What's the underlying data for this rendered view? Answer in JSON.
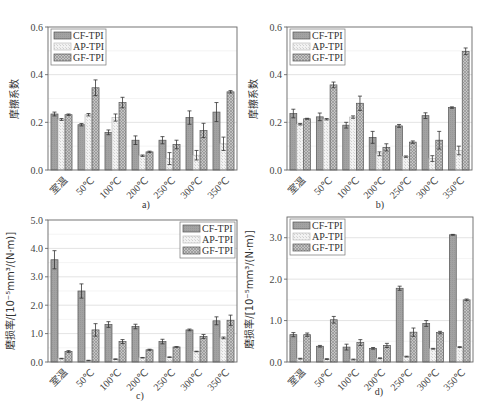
{
  "colors": {
    "cf": "#9e9e9e",
    "ap": "#ececec",
    "gf": "#b8b8b8",
    "outline": "#555555",
    "grid": "#d8d8d8"
  },
  "chart_data": [
    {
      "panel": "a)",
      "type": "bar",
      "title": "",
      "xlabel": "",
      "ylabel": "摩擦系数",
      "ylim": [
        0,
        0.6
      ],
      "yticks": [
        "0.0",
        "0.2",
        "0.4",
        "0.6"
      ],
      "categories": [
        "室温",
        "50℃",
        "100℃",
        "200℃",
        "250℃",
        "300℃",
        "350℃"
      ],
      "legend_position": "upper-left",
      "series": [
        {
          "name": "CF-TPI",
          "values": [
            0.235,
            0.19,
            0.158,
            0.125,
            0.125,
            0.22,
            0.243
          ],
          "errors": [
            0.008,
            0.005,
            0.01,
            0.018,
            0.015,
            0.028,
            0.04
          ]
        },
        {
          "name": "AP-TPI",
          "values": [
            0.212,
            0.232,
            0.22,
            0.06,
            0.048,
            0.062,
            0.11
          ],
          "errors": [
            0.004,
            0.005,
            0.015,
            0.003,
            0.025,
            0.02,
            0.028
          ]
        },
        {
          "name": "GF-TPI",
          "values": [
            0.232,
            0.345,
            0.283,
            0.076,
            0.107,
            0.166,
            0.328
          ],
          "errors": [
            0.003,
            0.033,
            0.022,
            0.003,
            0.018,
            0.03,
            0.005
          ]
        }
      ]
    },
    {
      "panel": "b)",
      "type": "bar",
      "title": "",
      "xlabel": "",
      "ylabel": "摩擦系数",
      "ylim": [
        0,
        0.6
      ],
      "yticks": [
        "0.0",
        "0.2",
        "0.4",
        "0.6"
      ],
      "categories": [
        "室温",
        "50℃",
        "100℃",
        "200℃",
        "250℃",
        "300℃",
        "350℃"
      ],
      "legend_position": "upper-left",
      "series": [
        {
          "name": "CF-TPI",
          "values": [
            0.237,
            0.223,
            0.188,
            0.137,
            0.185,
            0.228,
            0.262
          ],
          "errors": [
            0.018,
            0.016,
            0.012,
            0.025,
            0.006,
            0.012,
            0.003
          ]
        },
        {
          "name": "AP-TPI",
          "values": [
            0.192,
            0.213,
            0.222,
            0.068,
            0.056,
            0.048,
            0.082
          ],
          "errors": [
            0.003,
            0.003,
            0.005,
            0.008,
            0.003,
            0.012,
            0.018
          ]
        },
        {
          "name": "GF-TPI",
          "values": [
            0.215,
            0.357,
            0.28,
            0.095,
            0.117,
            0.125,
            0.498
          ],
          "errors": [
            0.002,
            0.012,
            0.03,
            0.015,
            0.005,
            0.037,
            0.014
          ]
        }
      ]
    },
    {
      "panel": "c)",
      "type": "bar",
      "title": "",
      "xlabel": "",
      "ylabel": "磨损率/[10⁻⁵mm³/(N·m)]",
      "ylim": [
        0,
        5.0
      ],
      "yticks": [
        "0.0",
        "1.0",
        "2.0",
        "3.0",
        "4.0",
        "5.0"
      ],
      "categories": [
        "室温",
        "50℃",
        "100℃",
        "200℃",
        "250℃",
        "300℃",
        "350℃"
      ],
      "legend_position": "upper-right",
      "series": [
        {
          "name": "CF-TPI",
          "values": [
            3.6,
            2.5,
            1.32,
            1.25,
            0.72,
            1.13,
            1.45
          ],
          "errors": [
            0.32,
            0.25,
            0.1,
            0.08,
            0.08,
            0.03,
            0.14
          ]
        },
        {
          "name": "AP-TPI",
          "values": [
            0.12,
            0.05,
            0.1,
            0.15,
            0.17,
            0.37,
            0.85
          ],
          "errors": [
            0.01,
            0.01,
            0.01,
            0.01,
            0.01,
            0.01,
            0.03
          ]
        },
        {
          "name": "GF-TPI",
          "values": [
            0.37,
            1.13,
            0.72,
            0.43,
            0.53,
            0.9,
            1.47
          ],
          "errors": [
            0.03,
            0.22,
            0.07,
            0.02,
            0.01,
            0.07,
            0.18
          ]
        }
      ]
    },
    {
      "panel": "d)",
      "type": "bar",
      "title": "",
      "xlabel": "",
      "ylabel": "磨损率/[10⁻⁵mm³/(N·m)]",
      "ylim": [
        0,
        3.5
      ],
      "yticks": [
        "0.0",
        "1.0",
        "2.0",
        "3.0"
      ],
      "categories": [
        "室温",
        "50℃",
        "100℃",
        "200℃",
        "250℃",
        "300℃",
        "350℃"
      ],
      "legend_position": "upper-left",
      "series": [
        {
          "name": "CF-TPI",
          "values": [
            0.66,
            0.38,
            0.36,
            0.33,
            1.78,
            0.93,
            3.07
          ],
          "errors": [
            0.05,
            0.02,
            0.07,
            0.02,
            0.05,
            0.07,
            0.01
          ]
        },
        {
          "name": "AP-TPI",
          "values": [
            0.08,
            0.07,
            0.06,
            0.09,
            0.13,
            0.32,
            0.36
          ],
          "errors": [
            0.01,
            0.01,
            0.01,
            0.01,
            0.01,
            0.01,
            0.01
          ]
        },
        {
          "name": "GF-TPI",
          "values": [
            0.66,
            1.02,
            0.47,
            0.4,
            0.72,
            0.71,
            1.5
          ],
          "errors": [
            0.04,
            0.08,
            0.07,
            0.05,
            0.1,
            0.03,
            0.02
          ]
        }
      ]
    }
  ]
}
